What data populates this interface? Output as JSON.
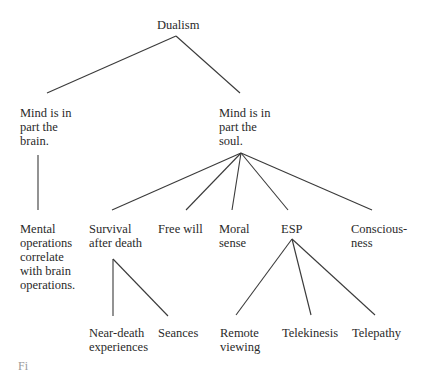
{
  "diagram": {
    "type": "tree",
    "root": {
      "id": "dualism",
      "label": "Dualism"
    },
    "nodes": [
      {
        "id": "dualism",
        "label": "Dualism",
        "x": 157,
        "y": 18
      },
      {
        "id": "brain",
        "label": "Mind is in\npart the\nbrain.",
        "parent": "dualism",
        "x": 20,
        "y": 106
      },
      {
        "id": "soul",
        "label": "Mind is in\npart the\nsoul.",
        "parent": "dualism",
        "x": 219,
        "y": 106
      },
      {
        "id": "mental_ops",
        "label": "Mental\noperations\ncorrelate\nwith brain\noperations.",
        "parent": "brain",
        "x": 20,
        "y": 222
      },
      {
        "id": "survival",
        "label": "Survival\nafter death",
        "parent": "soul",
        "x": 89,
        "y": 222
      },
      {
        "id": "free_will",
        "label": "Free will",
        "parent": "soul",
        "x": 158,
        "y": 222
      },
      {
        "id": "moral_sense",
        "label": "Moral\nsense",
        "parent": "soul",
        "x": 219,
        "y": 222
      },
      {
        "id": "esp",
        "label": "ESP",
        "parent": "soul",
        "x": 281,
        "y": 222
      },
      {
        "id": "consciousness",
        "label": "Conscious-\nness",
        "parent": "soul",
        "x": 351,
        "y": 222
      },
      {
        "id": "near_death",
        "label": "Near-death\nexperiences",
        "parent": "survival",
        "x": 89,
        "y": 326
      },
      {
        "id": "seances",
        "label": "Seances",
        "parent": "survival",
        "x": 158,
        "y": 326
      },
      {
        "id": "remote_viewing",
        "label": "Remote\nviewing",
        "parent": "esp",
        "x": 220,
        "y": 326
      },
      {
        "id": "telekinesis",
        "label": "Telekinesis",
        "parent": "esp",
        "x": 282,
        "y": 326
      },
      {
        "id": "telepathy",
        "label": "Telepathy",
        "parent": "esp",
        "x": 352,
        "y": 326
      }
    ],
    "edges": [
      {
        "from": "dualism",
        "to": "brain",
        "x1": 176,
        "y1": 36,
        "x2": 47,
        "y2": 93
      },
      {
        "from": "dualism",
        "to": "soul",
        "x1": 176,
        "y1": 36,
        "x2": 240,
        "y2": 93
      },
      {
        "from": "brain",
        "to": "mental_ops",
        "x1": 38,
        "y1": 155,
        "x2": 38,
        "y2": 210
      },
      {
        "from": "soul",
        "to": "survival",
        "x1": 241,
        "y1": 153,
        "x2": 112,
        "y2": 210
      },
      {
        "from": "soul",
        "to": "free_will",
        "x1": 241,
        "y1": 153,
        "x2": 186,
        "y2": 210
      },
      {
        "from": "soul",
        "to": "moral_sense",
        "x1": 241,
        "y1": 153,
        "x2": 232,
        "y2": 210
      },
      {
        "from": "soul",
        "to": "esp",
        "x1": 241,
        "y1": 153,
        "x2": 288,
        "y2": 210
      },
      {
        "from": "soul",
        "to": "consciousness",
        "x1": 241,
        "y1": 153,
        "x2": 372,
        "y2": 210
      },
      {
        "from": "survival",
        "to": "near_death",
        "x1": 113,
        "y1": 259,
        "x2": 113,
        "y2": 316
      },
      {
        "from": "survival",
        "to": "seances",
        "x1": 113,
        "y1": 259,
        "x2": 168,
        "y2": 316
      },
      {
        "from": "esp",
        "to": "remote_viewing",
        "x1": 292,
        "y1": 239,
        "x2": 236,
        "y2": 315
      },
      {
        "from": "esp",
        "to": "telekinesis",
        "x1": 292,
        "y1": 239,
        "x2": 311,
        "y2": 315
      },
      {
        "from": "esp",
        "to": "telepathy",
        "x1": 292,
        "y1": 239,
        "x2": 375,
        "y2": 315
      }
    ]
  },
  "labels": {
    "dualism": "Dualism",
    "brain": "Mind is in\npart the\nbrain.",
    "soul": "Mind is in\npart the\nsoul.",
    "mental_ops": "Mental\noperations\ncorrelate\nwith brain\noperations.",
    "survival": "Survival\nafter death",
    "free_will": "Free will",
    "moral_sense": "Moral\nsense",
    "esp": "ESP",
    "consciousness": "Conscious-\nness",
    "near_death": "Near-death\nexperiences",
    "seances": "Seances",
    "remote_viewing": "Remote\nviewing",
    "telekinesis": "Telekinesis",
    "telepathy": "Telepathy"
  },
  "caption": {
    "partial_text": "Fi"
  },
  "colors": {
    "text": "#2a2a2a",
    "lines": "#3a3a3a",
    "background": "#ffffff"
  }
}
